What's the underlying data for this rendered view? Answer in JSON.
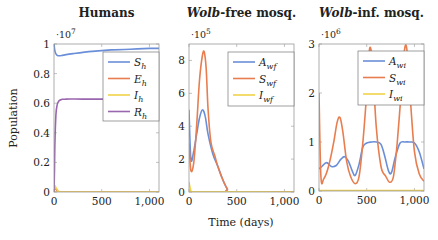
{
  "colors": {
    "blue": "#6a8fd8",
    "orange": "#e87e4f",
    "yellow": "#f1d24a",
    "purple": "#9a66b0",
    "axis": "#999999",
    "grid": "#dddddd"
  },
  "figure": {
    "ylabel": "Population",
    "xlabel": "Time (days)"
  },
  "chart_data": [
    {
      "type": "line",
      "title": "Humans",
      "exponent": "·10^7",
      "xlabel": "",
      "ylabel": "Population",
      "xlim": [
        0,
        1100
      ],
      "ylim": [
        0,
        1
      ],
      "xticks": [
        "0",
        "500",
        "1,000"
      ],
      "yticks": [
        "0",
        "0.2",
        "0.4",
        "0.6",
        "0.8",
        "1"
      ],
      "legend": [
        "S_h",
        "E_h",
        "I_h",
        "R_h"
      ],
      "series": [
        {
          "name": "S_h",
          "color": "blue",
          "x": [
            0,
            10,
            30,
            60,
            100,
            200,
            400,
            600,
            800,
            1000,
            1100
          ],
          "y": [
            1.0,
            0.95,
            0.925,
            0.92,
            0.925,
            0.935,
            0.95,
            0.96,
            0.965,
            0.97,
            0.97
          ]
        },
        {
          "name": "E_h",
          "color": "orange",
          "x": [
            0,
            10,
            20,
            40,
            60,
            100,
            1100
          ],
          "y": [
            0.0,
            0.03,
            0.02,
            0.005,
            0.0,
            0.0,
            0.0
          ]
        },
        {
          "name": "I_h",
          "color": "yellow",
          "x": [
            0,
            10,
            20,
            40,
            60,
            100,
            1100
          ],
          "y": [
            0.0,
            0.04,
            0.03,
            0.01,
            0.002,
            0.0,
            0.0
          ]
        },
        {
          "name": "R_h",
          "color": "purple",
          "x": [
            0,
            5,
            10,
            20,
            30,
            50,
            80,
            120,
            300,
            600,
            1100
          ],
          "y": [
            0.0,
            0.15,
            0.35,
            0.52,
            0.58,
            0.615,
            0.625,
            0.628,
            0.628,
            0.628,
            0.628
          ]
        }
      ]
    },
    {
      "type": "line",
      "title": "Wolb-free mosq.",
      "title_italic": "Wolb",
      "title_rest": "-free mosq.",
      "exponent": "·10^5",
      "xlabel": "Time (days)",
      "xlim": [
        0,
        1100
      ],
      "ylim": [
        0,
        9
      ],
      "xticks": [
        "0",
        "500",
        "1,000"
      ],
      "yticks": [
        "0",
        "2",
        "4",
        "6",
        "8"
      ],
      "legend": [
        "A_wf",
        "S_wf",
        "I_wf"
      ],
      "series": [
        {
          "name": "A_wf",
          "color": "blue",
          "x": [
            0,
            20,
            50,
            80,
            110,
            140,
            170,
            200,
            250,
            300,
            350,
            400,
            450,
            1100
          ],
          "y": [
            5.0,
            2.0,
            2.5,
            3.5,
            4.5,
            5.0,
            4.6,
            3.5,
            2.3,
            1.6,
            0.8,
            0.2,
            0.0,
            0.0
          ]
        },
        {
          "name": "S_wf",
          "color": "orange",
          "x": [
            0,
            20,
            50,
            80,
            110,
            140,
            160,
            180,
            200,
            230,
            270,
            300,
            350,
            400,
            450,
            1100
          ],
          "y": [
            3.0,
            1.3,
            1.8,
            4.0,
            6.8,
            8.3,
            8.5,
            7.5,
            5.0,
            3.0,
            2.2,
            1.6,
            0.8,
            0.2,
            0.0,
            0.0
          ]
        },
        {
          "name": "I_wf",
          "color": "yellow",
          "x": [
            0,
            10,
            20,
            40,
            1100
          ],
          "y": [
            0.6,
            0.3,
            0.1,
            0.02,
            0.0
          ]
        }
      ]
    },
    {
      "type": "line",
      "title": "Wolb-inf. mosq.",
      "title_italic": "Wolb",
      "title_rest": "-inf. mosq.",
      "exponent": "·10^6",
      "xlabel": "",
      "xlim": [
        0,
        1100
      ],
      "ylim": [
        0,
        3
      ],
      "xticks": [
        "0",
        "500",
        "1,000"
      ],
      "yticks": [
        "0",
        "1",
        "2",
        "3"
      ],
      "legend": [
        "A_wi",
        "S_wi",
        "I_wi"
      ],
      "series": [
        {
          "name": "A_wi",
          "color": "blue",
          "x": [
            0,
            30,
            80,
            130,
            180,
            230,
            270,
            310,
            350,
            380,
            420,
            460,
            500,
            550,
            600,
            650,
            690,
            730,
            760,
            800,
            850,
            900,
            950,
            1000,
            1050,
            1100
          ],
          "y": [
            0.45,
            0.5,
            0.58,
            0.5,
            0.52,
            0.65,
            0.7,
            0.6,
            0.4,
            0.32,
            0.55,
            0.9,
            0.98,
            1.0,
            1.0,
            0.95,
            0.7,
            0.4,
            0.38,
            0.7,
            0.98,
            1.0,
            1.0,
            0.98,
            0.8,
            0.45
          ]
        },
        {
          "name": "S_wi",
          "color": "orange",
          "x": [
            0,
            20,
            50,
            100,
            150,
            190,
            220,
            250,
            290,
            330,
            380,
            420,
            460,
            500,
            530,
            560,
            600,
            650,
            700,
            740,
            780,
            820,
            860,
            890,
            920,
            960,
            1000,
            1050,
            1100
          ],
          "y": [
            2.0,
            0.3,
            0.25,
            0.5,
            0.95,
            1.4,
            1.5,
            1.2,
            0.6,
            0.3,
            0.15,
            0.3,
            1.0,
            2.0,
            2.9,
            2.6,
            1.3,
            0.5,
            0.3,
            0.18,
            0.3,
            1.0,
            2.0,
            2.8,
            2.9,
            1.8,
            0.8,
            0.35,
            0.2
          ]
        },
        {
          "name": "I_wi",
          "color": "yellow",
          "x": [
            0,
            1100
          ],
          "y": [
            0.01,
            0.01
          ]
        }
      ]
    }
  ]
}
